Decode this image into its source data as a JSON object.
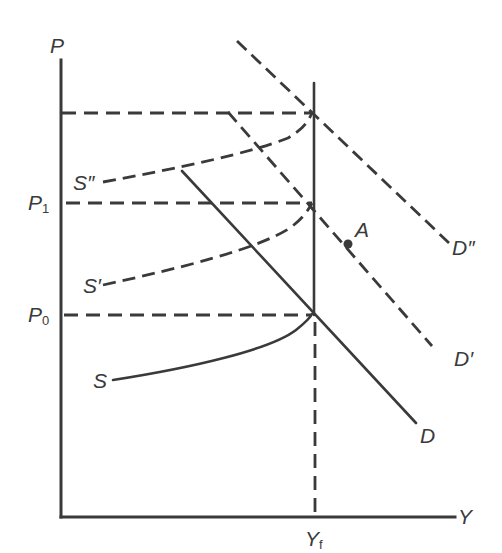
{
  "diagram": {
    "type": "economics supply-demand shift diagram",
    "axes": {
      "y_axis_label": "P",
      "x_axis_label": "Y"
    },
    "price_levels": [
      {
        "label": "P",
        "subscript": "1",
        "name": "P1"
      },
      {
        "label": "P",
        "subscript": "0",
        "name": "P0"
      }
    ],
    "output_marks": [
      {
        "label": "Y",
        "subscript": "f",
        "name": "Yf"
      }
    ],
    "supply_curves": [
      {
        "label": "S",
        "style": "solid"
      },
      {
        "label": "S′",
        "style": "dashed"
      },
      {
        "label": "S″",
        "style": "dashed"
      }
    ],
    "demand_curves": [
      {
        "label": "D",
        "style": "solid"
      },
      {
        "label": "D′",
        "style": "dashed"
      },
      {
        "label": "D″",
        "style": "dashed"
      }
    ],
    "points": [
      {
        "label": "A"
      }
    ],
    "colors": {
      "ink": "#3a3a3a",
      "background": "#ffffff"
    }
  }
}
